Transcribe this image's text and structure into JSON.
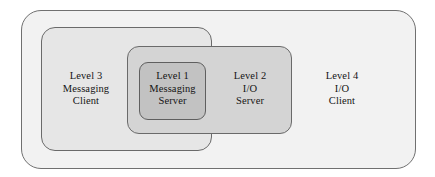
{
  "diagram": {
    "type": "nested-rounded-rectangles",
    "background_color": "#ffffff",
    "regions": [
      {
        "id": "level4",
        "name": "Level 4 I/O Client",
        "lines": [
          "Level 4",
          "I/O",
          "Client"
        ],
        "fill": "#f2f2f2",
        "stroke": "#707070",
        "nesting_depth": 1
      },
      {
        "id": "level3",
        "name": "Level 3 Messaging Client",
        "lines": [
          "Level 3",
          "Messaging",
          "Client"
        ],
        "fill": "#e6e6e6",
        "stroke": "#6a6a6a",
        "nesting_depth": 2
      },
      {
        "id": "level2",
        "name": "Level 2 I/O Server",
        "lines": [
          "Level 2",
          "I/O",
          "Server"
        ],
        "fill": "#d4d4d4",
        "stroke": "#6a6a6a",
        "nesting_depth": 3
      },
      {
        "id": "level1",
        "name": "Level 1 Messaging Server",
        "lines": [
          "Level 1",
          "Messaging",
          "Server"
        ],
        "fill": "#c2c2c2",
        "stroke": "#5f5f5f",
        "nesting_depth": 4
      }
    ]
  }
}
